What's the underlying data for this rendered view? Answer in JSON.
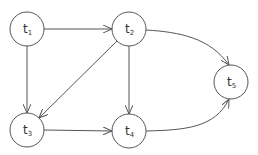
{
  "diagram": {
    "type": "directed-graph",
    "stroke_color": "#555555",
    "nodes": [
      {
        "id": "t1",
        "base": "t",
        "sub": "1",
        "cx": 27,
        "cy": 29,
        "r": 17
      },
      {
        "id": "t2",
        "base": "t",
        "sub": "2",
        "cx": 129,
        "cy": 29,
        "r": 17
      },
      {
        "id": "t3",
        "base": "t",
        "sub": "3",
        "cx": 27,
        "cy": 130,
        "r": 17
      },
      {
        "id": "t4",
        "base": "t",
        "sub": "4",
        "cx": 129,
        "cy": 131,
        "r": 17
      },
      {
        "id": "t5",
        "base": "t",
        "sub": "5",
        "cx": 231,
        "cy": 82,
        "r": 17
      }
    ],
    "edges": [
      {
        "from": "t1",
        "to": "t2",
        "shape": "straight"
      },
      {
        "from": "t1",
        "to": "t3",
        "shape": "straight"
      },
      {
        "from": "t2",
        "to": "t3",
        "shape": "straight"
      },
      {
        "from": "t2",
        "to": "t4",
        "shape": "straight"
      },
      {
        "from": "t2",
        "to": "t5",
        "shape": "curved"
      },
      {
        "from": "t3",
        "to": "t4",
        "shape": "straight"
      },
      {
        "from": "t4",
        "to": "t5",
        "shape": "curved"
      }
    ]
  }
}
